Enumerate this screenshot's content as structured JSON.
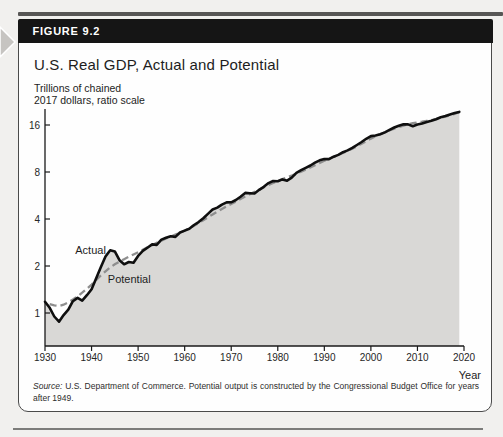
{
  "figure": {
    "label": "FIGURE 9.2",
    "title": "U.S. Real GDP, Actual and Potential",
    "y_unit_line1": "Trillions of chained",
    "y_unit_line2": "2017 dollars, ratio scale",
    "x_axis_label": "Year",
    "source_label": "Source:",
    "source_text": " U.S. Department of Commerce. Potential output is constructed by the Congressional Budget Office for years after 1949.",
    "colors": {
      "page_bg": "#f1f0ee",
      "box_bg": "#fefefe",
      "header_bg": "#151515",
      "header_text": "#ffffff",
      "box_border": "#4a4a4a",
      "area_fill": "#d9d8d6",
      "actual_line": "#0f0f0f",
      "potential_line": "#8e8e8e",
      "axis": "#1a1a1a",
      "text": "#1d1d1d",
      "tick_text": "#262626",
      "arrow": "#c6c4c1",
      "strip": "#3c3b39",
      "rule": "#7c7c7a"
    }
  },
  "chart_data": {
    "type": "line",
    "title": "U.S. Real GDP, Actual and Potential",
    "xlabel": "Year",
    "ylabel": "Trillions of chained 2017 dollars, ratio scale",
    "y_scale": "log2 (ratio scale)",
    "x_range": [
      1930,
      2020
    ],
    "ylim": [
      0.6,
      20
    ],
    "y_ticks": [
      1,
      2,
      4,
      8,
      16
    ],
    "x_ticks": [
      1930,
      1940,
      1950,
      1960,
      1970,
      1980,
      1990,
      2000,
      2010,
      2020
    ],
    "grid": false,
    "legend": "inline-labels",
    "annotations": [
      {
        "text": "Actual",
        "year": 1936.5,
        "value": 2.4
      },
      {
        "text": "Potential",
        "year": 1943.5,
        "value": 1.56
      }
    ],
    "series": [
      {
        "name": "Actual",
        "line": "solid-black",
        "area_fill": true,
        "points": [
          [
            1930,
            1.18
          ],
          [
            1931,
            1.08
          ],
          [
            1932,
            0.95
          ],
          [
            1933,
            0.88
          ],
          [
            1934,
            0.97
          ],
          [
            1935,
            1.05
          ],
          [
            1936,
            1.19
          ],
          [
            1937,
            1.25
          ],
          [
            1938,
            1.2
          ],
          [
            1939,
            1.3
          ],
          [
            1940,
            1.42
          ],
          [
            1941,
            1.67
          ],
          [
            1942,
            1.97
          ],
          [
            1943,
            2.3
          ],
          [
            1944,
            2.52
          ],
          [
            1945,
            2.48
          ],
          [
            1946,
            2.18
          ],
          [
            1947,
            2.05
          ],
          [
            1948,
            2.12
          ],
          [
            1949,
            2.1
          ],
          [
            1950,
            2.32
          ],
          [
            1951,
            2.5
          ],
          [
            1952,
            2.62
          ],
          [
            1953,
            2.75
          ],
          [
            1954,
            2.73
          ],
          [
            1955,
            2.95
          ],
          [
            1956,
            3.03
          ],
          [
            1957,
            3.1
          ],
          [
            1958,
            3.07
          ],
          [
            1959,
            3.28
          ],
          [
            1960,
            3.37
          ],
          [
            1961,
            3.46
          ],
          [
            1962,
            3.66
          ],
          [
            1963,
            3.82
          ],
          [
            1964,
            4.05
          ],
          [
            1965,
            4.31
          ],
          [
            1966,
            4.6
          ],
          [
            1967,
            4.73
          ],
          [
            1968,
            4.95
          ],
          [
            1969,
            5.11
          ],
          [
            1970,
            5.12
          ],
          [
            1971,
            5.29
          ],
          [
            1972,
            5.56
          ],
          [
            1973,
            5.88
          ],
          [
            1974,
            5.85
          ],
          [
            1975,
            5.83
          ],
          [
            1976,
            6.15
          ],
          [
            1977,
            6.43
          ],
          [
            1978,
            6.79
          ],
          [
            1979,
            7.01
          ],
          [
            1980,
            6.99
          ],
          [
            1981,
            7.17
          ],
          [
            1982,
            7.04
          ],
          [
            1983,
            7.36
          ],
          [
            1984,
            7.9
          ],
          [
            1985,
            8.22
          ],
          [
            1986,
            8.51
          ],
          [
            1987,
            8.81
          ],
          [
            1988,
            9.17
          ],
          [
            1989,
            9.51
          ],
          [
            1990,
            9.69
          ],
          [
            1991,
            9.68
          ],
          [
            1992,
            10.02
          ],
          [
            1993,
            10.3
          ],
          [
            1994,
            10.71
          ],
          [
            1995,
            11.0
          ],
          [
            1996,
            11.41
          ],
          [
            1997,
            11.92
          ],
          [
            1998,
            12.46
          ],
          [
            1999,
            13.05
          ],
          [
            2000,
            13.58
          ],
          [
            2001,
            13.71
          ],
          [
            2002,
            13.95
          ],
          [
            2003,
            14.34
          ],
          [
            2004,
            14.89
          ],
          [
            2005,
            15.41
          ],
          [
            2006,
            15.84
          ],
          [
            2007,
            16.16
          ],
          [
            2008,
            16.14
          ],
          [
            2009,
            15.72
          ],
          [
            2010,
            16.13
          ],
          [
            2011,
            16.38
          ],
          [
            2012,
            16.74
          ],
          [
            2013,
            17.05
          ],
          [
            2014,
            17.43
          ],
          [
            2015,
            17.95
          ],
          [
            2016,
            18.25
          ],
          [
            2017,
            18.67
          ],
          [
            2018,
            19.1
          ],
          [
            2019,
            19.4
          ]
        ]
      },
      {
        "name": "Potential",
        "line": "dashed-gray",
        "area_fill": false,
        "points": [
          [
            1931,
            1.14
          ],
          [
            1932,
            1.12
          ],
          [
            1933,
            1.11
          ],
          [
            1934,
            1.13
          ],
          [
            1935,
            1.17
          ],
          [
            1936,
            1.22
          ],
          [
            1937,
            1.28
          ],
          [
            1938,
            1.35
          ],
          [
            1939,
            1.43
          ],
          [
            1940,
            1.52
          ],
          [
            1941,
            1.63
          ],
          [
            1942,
            1.74
          ],
          [
            1943,
            1.85
          ],
          [
            1944,
            1.96
          ],
          [
            1945,
            2.05
          ],
          [
            1946,
            2.13
          ],
          [
            1947,
            2.21
          ],
          [
            1948,
            2.29
          ],
          [
            1949,
            2.37
          ],
          [
            1950,
            2.45
          ],
          [
            1951,
            2.54
          ],
          [
            1952,
            2.63
          ],
          [
            1953,
            2.72
          ],
          [
            1954,
            2.81
          ],
          [
            1955,
            2.91
          ],
          [
            1956,
            3.0
          ],
          [
            1957,
            3.09
          ],
          [
            1958,
            3.18
          ],
          [
            1959,
            3.27
          ],
          [
            1960,
            3.37
          ],
          [
            1961,
            3.49
          ],
          [
            1962,
            3.62
          ],
          [
            1963,
            3.77
          ],
          [
            1964,
            3.93
          ],
          [
            1965,
            4.1
          ],
          [
            1966,
            4.28
          ],
          [
            1967,
            4.46
          ],
          [
            1968,
            4.64
          ],
          [
            1969,
            4.82
          ],
          [
            1970,
            5.0
          ],
          [
            1971,
            5.18
          ],
          [
            1972,
            5.37
          ],
          [
            1973,
            5.57
          ],
          [
            1974,
            5.77
          ],
          [
            1975,
            5.97
          ],
          [
            1976,
            6.17
          ],
          [
            1977,
            6.38
          ],
          [
            1978,
            6.59
          ],
          [
            1979,
            6.8
          ],
          [
            1980,
            7.01
          ],
          [
            1981,
            7.21
          ],
          [
            1982,
            7.4
          ],
          [
            1983,
            7.59
          ],
          [
            1984,
            7.8
          ],
          [
            1985,
            8.03
          ],
          [
            1986,
            8.28
          ],
          [
            1987,
            8.55
          ],
          [
            1988,
            8.84
          ],
          [
            1989,
            9.14
          ],
          [
            1990,
            9.43
          ],
          [
            1991,
            9.71
          ],
          [
            1992,
            9.99
          ],
          [
            1993,
            10.28
          ],
          [
            1994,
            10.59
          ],
          [
            1995,
            10.92
          ],
          [
            1996,
            11.29
          ],
          [
            1997,
            11.7
          ],
          [
            1998,
            12.15
          ],
          [
            1999,
            12.62
          ],
          [
            2000,
            13.1
          ],
          [
            2001,
            13.55
          ],
          [
            2002,
            13.97
          ],
          [
            2003,
            14.37
          ],
          [
            2004,
            14.76
          ],
          [
            2005,
            15.14
          ],
          [
            2006,
            15.51
          ],
          [
            2007,
            15.86
          ],
          [
            2008,
            16.17
          ],
          [
            2009,
            16.42
          ],
          [
            2010,
            16.62
          ],
          [
            2011,
            16.81
          ],
          [
            2012,
            17.01
          ],
          [
            2013,
            17.23
          ],
          [
            2014,
            17.48
          ],
          [
            2015,
            17.77
          ],
          [
            2016,
            18.1
          ],
          [
            2017,
            18.47
          ],
          [
            2018,
            18.88
          ],
          [
            2019,
            19.4
          ]
        ]
      }
    ]
  }
}
